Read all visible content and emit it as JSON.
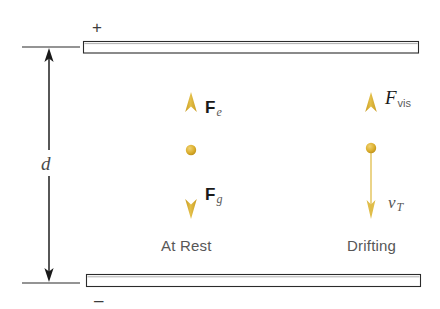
{
  "figure": {
    "background_color": "#ffffff",
    "arrow_color": "#d9ae2e",
    "arrow_color_light": "#e8ca63",
    "plate_stroke_color": "#2b2b2b",
    "dimension_line_color": "#1a1a1a",
    "text_color": "#4a4a4a"
  },
  "plates": {
    "top": {
      "polarity_label": "+",
      "name": "positive-plate",
      "x": 83,
      "y": 41,
      "width": 336,
      "height": 12
    },
    "bottom": {
      "polarity_label": "–",
      "name": "negative-plate",
      "x": 86,
      "y": 274,
      "width": 335,
      "height": 13
    }
  },
  "dimension": {
    "label": "d",
    "description": "plate separation distance",
    "top_tick_y": 47,
    "bottom_tick_y": 283,
    "axis_x": 49,
    "tick_x_start": 22,
    "tick_x_end": 80
  },
  "scenarios": [
    {
      "name": "at-rest",
      "caption": "At Rest",
      "center_x": 191,
      "droplet_y": 150,
      "arrows": [
        {
          "name": "electric-force-arrow",
          "direction": "up",
          "label_main": "F",
          "label_style": "bold",
          "label_sub": "e",
          "sub_style": "italic",
          "tip_y": 93,
          "tail_y": 150,
          "weight": "thick"
        },
        {
          "name": "gravitational-force-arrow",
          "direction": "down",
          "label_main": "F",
          "label_style": "bold",
          "label_sub": "g",
          "sub_style": "italic",
          "tip_y": 218,
          "tail_y": 150,
          "weight": "thick"
        }
      ]
    },
    {
      "name": "drifting",
      "caption": "Drifting",
      "center_x": 371,
      "droplet_y": 148,
      "arrows": [
        {
          "name": "viscous-force-arrow",
          "direction": "up",
          "label_main": "F",
          "label_style": "italic",
          "label_sub": "vis",
          "sub_style": "upright",
          "tip_y": 93,
          "tail_y": 148,
          "weight": "thick"
        },
        {
          "name": "terminal-velocity-arrow",
          "direction": "down",
          "label_main": "v",
          "label_style": "italic",
          "label_sub": "T",
          "sub_style": "italic",
          "tip_y": 218,
          "tail_y": 148,
          "weight": "thin"
        }
      ]
    }
  ]
}
